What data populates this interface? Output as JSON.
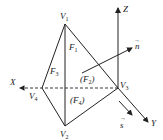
{
  "diagram": {
    "title": "",
    "vertices": [
      {
        "id": "V1",
        "label": "V",
        "sub": "1"
      },
      {
        "id": "V2",
        "label": "V",
        "sub": "2"
      },
      {
        "id": "V3",
        "label": "V",
        "sub": "3"
      },
      {
        "id": "V4",
        "label": "V",
        "sub": "4"
      }
    ],
    "faces": [
      {
        "id": "F1",
        "label": "F",
        "sub": "1",
        "paren": false
      },
      {
        "id": "F2",
        "label": "(F",
        "sub": "2",
        "close": ")",
        "paren": true
      },
      {
        "id": "F3",
        "label": "F",
        "sub": "3",
        "paren": false
      },
      {
        "id": "F4",
        "label": "(F",
        "sub": "4",
        "close": ")",
        "paren": true
      }
    ],
    "axes": {
      "x": "X",
      "y": "Y",
      "z": "Z"
    },
    "vectors": {
      "n": "n",
      "s": "s",
      "arrow_mark": "→"
    },
    "edges": [
      {
        "from": "V1",
        "to": "V2",
        "style": "solid"
      },
      {
        "from": "V1",
        "to": "V3",
        "style": "solid"
      },
      {
        "from": "V1",
        "to": "V4",
        "style": "solid"
      },
      {
        "from": "V2",
        "to": "V3",
        "style": "solid"
      },
      {
        "from": "V2",
        "to": "V4",
        "style": "solid"
      },
      {
        "from": "V4",
        "to": "V3",
        "style": "dashed"
      }
    ],
    "colors": {
      "ink": "#222222",
      "background": "#ffffff"
    }
  }
}
